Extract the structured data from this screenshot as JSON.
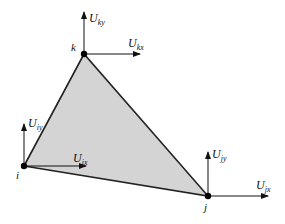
{
  "diagram": {
    "type": "triangular finite element with nodal displacements",
    "fill_color": "#d4d4d4",
    "edge_color": "#222222",
    "nodes": [
      {
        "id": "i",
        "label": "i",
        "x": 24,
        "y": 166,
        "dofs": {
          "x": {
            "main": "U",
            "sub": "ix"
          },
          "y": {
            "main": "U",
            "sub": "iy"
          }
        }
      },
      {
        "id": "j",
        "label": "j",
        "x": 208,
        "y": 196,
        "dofs": {
          "x": {
            "main": "U",
            "sub": "jx"
          },
          "y": {
            "main": "U",
            "sub": "jy"
          }
        }
      },
      {
        "id": "k",
        "label": "k",
        "x": 84,
        "y": 54,
        "dofs": {
          "x": {
            "main": "U",
            "sub": "kx"
          },
          "y": {
            "main": "U",
            "sub": "ky"
          }
        }
      }
    ]
  }
}
